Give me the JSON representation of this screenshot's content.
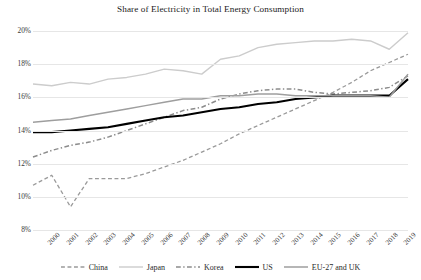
{
  "chart_data": {
    "type": "line",
    "title": "Share of Electricity in Total Energy Consumption",
    "xlabel": "",
    "ylabel": "",
    "ylim": [
      8,
      20
    ],
    "ytick_labels": [
      "8%",
      "10%",
      "12%",
      "14%",
      "16%",
      "18%",
      "20%"
    ],
    "ytick_values": [
      8,
      10,
      12,
      14,
      16,
      18,
      20
    ],
    "grid": true,
    "legend_position": "bottom",
    "x": [
      2000,
      2001,
      2002,
      2003,
      2004,
      2005,
      2006,
      2007,
      2008,
      2009,
      2010,
      2011,
      2012,
      2013,
      2014,
      2015,
      2016,
      2017,
      2018,
      2019,
      2020
    ],
    "xtick_labels": [
      "2000",
      "2001",
      "2002",
      "2003",
      "2004",
      "2005",
      "2006",
      "2007",
      "2008",
      "2009",
      "2010",
      "2011",
      "2012",
      "2013",
      "2014",
      "2015",
      "2016",
      "2017",
      "2018",
      "2019",
      "2020"
    ],
    "series": [
      {
        "name": "China",
        "color": "#9a9a9a",
        "style": "dashed",
        "width": 1.3,
        "values": [
          10.7,
          11.3,
          9.4,
          11.1,
          11.1,
          11.1,
          11.4,
          11.8,
          12.2,
          12.7,
          13.2,
          13.8,
          14.3,
          14.8,
          15.3,
          15.8,
          16.3,
          16.9,
          17.6,
          18.1,
          18.6
        ]
      },
      {
        "name": "Japan",
        "color": "#cccccc",
        "style": "solid",
        "width": 1.4,
        "values": [
          16.8,
          16.7,
          16.9,
          16.8,
          17.1,
          17.2,
          17.4,
          17.7,
          17.6,
          17.4,
          18.3,
          18.5,
          19.0,
          19.2,
          19.3,
          19.4,
          19.4,
          19.5,
          19.4,
          18.9,
          19.9
        ]
      },
      {
        "name": "Korea",
        "color": "#8c8c8c",
        "style": "dashdot",
        "width": 1.5,
        "values": [
          12.4,
          12.8,
          13.1,
          13.3,
          13.6,
          14.0,
          14.4,
          14.8,
          15.2,
          15.4,
          15.9,
          16.2,
          16.4,
          16.5,
          16.5,
          16.3,
          16.2,
          16.3,
          16.4,
          16.6,
          17.3
        ]
      },
      {
        "name": "US",
        "color": "#000000",
        "style": "solid",
        "width": 2.1,
        "values": [
          13.9,
          13.9,
          14.0,
          14.1,
          14.2,
          14.4,
          14.6,
          14.8,
          14.9,
          15.1,
          15.3,
          15.4,
          15.6,
          15.7,
          15.9,
          16.0,
          16.1,
          16.1,
          16.1,
          16.1,
          17.1
        ]
      },
      {
        "name": "EU-27 and UK",
        "color": "#9e9e9e",
        "style": "solid",
        "width": 1.5,
        "values": [
          14.5,
          14.6,
          14.7,
          14.9,
          15.1,
          15.3,
          15.5,
          15.7,
          15.9,
          15.9,
          16.1,
          16.1,
          16.2,
          16.2,
          16.1,
          16.1,
          16.1,
          16.1,
          16.1,
          16.0,
          17.4
        ]
      }
    ]
  }
}
